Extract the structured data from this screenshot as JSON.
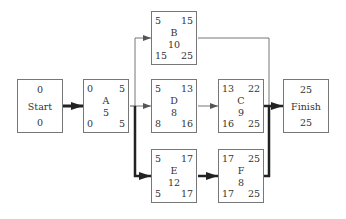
{
  "diagram": {
    "type": "activity-on-node network",
    "nodes": {
      "start": {
        "label": "Start",
        "top": "0",
        "bottom": "0"
      },
      "finish": {
        "label": "Finish",
        "top": "25",
        "bottom": "25"
      },
      "A": {
        "label": "A",
        "duration": "5",
        "es": "0",
        "ef": "5",
        "ls": "0",
        "lf": "5"
      },
      "B": {
        "label": "B",
        "duration": "10",
        "es": "5",
        "ef": "15",
        "ls": "15",
        "lf": "25"
      },
      "D": {
        "label": "D",
        "duration": "8",
        "es": "5",
        "ef": "13",
        "ls": "8",
        "lf": "16"
      },
      "C": {
        "label": "C",
        "duration": "9",
        "es": "13",
        "ef": "22",
        "ls": "16",
        "lf": "25"
      },
      "E": {
        "label": "E",
        "duration": "12",
        "es": "5",
        "ef": "17",
        "ls": "5",
        "lf": "17"
      },
      "F": {
        "label": "F",
        "duration": "8",
        "es": "17",
        "ef": "25",
        "ls": "17",
        "lf": "25"
      }
    },
    "edges": [
      {
        "from": "Start",
        "to": "A",
        "critical": true
      },
      {
        "from": "A",
        "to": "B",
        "critical": false
      },
      {
        "from": "A",
        "to": "D",
        "critical": false
      },
      {
        "from": "A",
        "to": "E",
        "critical": true
      },
      {
        "from": "D",
        "to": "C",
        "critical": false
      },
      {
        "from": "B",
        "to": "Finish",
        "critical": false
      },
      {
        "from": "C",
        "to": "Finish",
        "critical": false
      },
      {
        "from": "E",
        "to": "F",
        "critical": true
      },
      {
        "from": "F",
        "to": "Finish",
        "critical": true
      }
    ],
    "colors": {
      "line": "#777777",
      "critical_line": "#222222",
      "text": "#333333",
      "box_border": "#777777"
    }
  }
}
